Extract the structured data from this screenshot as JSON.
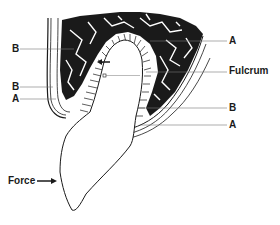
{
  "figure": {
    "labels": {
      "left_b_upper": "B",
      "left_b_lower": "B",
      "left_a": "A",
      "right_a_upper": "A",
      "fulcrum": "Fulcrum",
      "right_b": "B",
      "right_a_lower": "A",
      "force": "Force"
    },
    "icons": {
      "force_arrow": "arrow-right-icon",
      "movement_arrow": "arrow-left-icon",
      "center_marker": "square-marker-icon"
    },
    "colors": {
      "ink": "#1a1a1a",
      "background": "#ffffff"
    }
  }
}
